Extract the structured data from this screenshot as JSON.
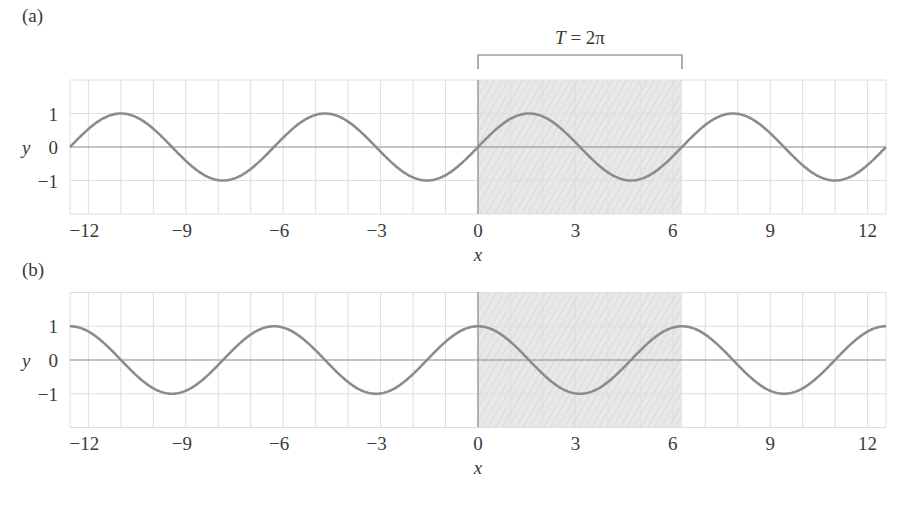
{
  "chart_data": [
    {
      "type": "line",
      "panel_label": "(a)",
      "function": "y = sin(x)",
      "xlabel": "x",
      "ylabel": "y",
      "xlim": [
        -12.566,
        12.566
      ],
      "ylim": [
        -2,
        2
      ],
      "x_ticks": [
        -12,
        -9,
        -6,
        -3,
        0,
        3,
        6,
        9,
        12
      ],
      "y_ticks": [
        1,
        0,
        -1
      ],
      "grid": true,
      "shaded_region": [
        0,
        6.283
      ],
      "annotation": "T = 2π",
      "series": [
        {
          "name": "sin(x)",
          "color": "#8c8c8c",
          "x": [
            -12.566,
            -10.996,
            -9.425,
            -7.854,
            -6.283,
            -4.712,
            -3.142,
            -1.571,
            0,
            1.571,
            3.142,
            4.712,
            6.283,
            7.854,
            9.425,
            10.996,
            12.566
          ],
          "values": [
            0,
            1,
            0,
            -1,
            0,
            1,
            0,
            -1,
            0,
            1,
            0,
            -1,
            0,
            1,
            0,
            -1,
            0
          ]
        }
      ]
    },
    {
      "type": "line",
      "panel_label": "(b)",
      "function": "y = cos(x)",
      "xlabel": "x",
      "ylabel": "y",
      "xlim": [
        -12.566,
        12.566
      ],
      "ylim": [
        -2,
        2
      ],
      "x_ticks": [
        -12,
        -9,
        -6,
        -3,
        0,
        3,
        6,
        9,
        12
      ],
      "y_ticks": [
        1,
        0,
        -1
      ],
      "grid": true,
      "shaded_region": [
        0,
        6.283
      ],
      "series": [
        {
          "name": "cos(x)",
          "color": "#8c8c8c",
          "x": [
            -12.566,
            -10.996,
            -9.425,
            -7.854,
            -6.283,
            -4.712,
            -3.142,
            -1.571,
            0,
            1.571,
            3.142,
            4.712,
            6.283,
            7.854,
            9.425,
            10.996,
            12.566
          ],
          "values": [
            1,
            0,
            -1,
            0,
            1,
            0,
            -1,
            0,
            1,
            0,
            -1,
            0,
            1,
            0,
            -1,
            0,
            1
          ]
        }
      ]
    }
  ],
  "panels": [
    {
      "label": "(a)",
      "fn": "sin",
      "top": 80,
      "bottom": 214,
      "zero": 147,
      "label_y": 22
    },
    {
      "label": "(b)",
      "fn": "cos",
      "top": 292,
      "bottom": 427,
      "zero": 360,
      "label_y": 276
    }
  ],
  "annotation": {
    "text": "T = 2π",
    "T": "T",
    "eq": " = 2π"
  },
  "axis": {
    "xlabel": "x",
    "ylabel": "y",
    "x_ticks": [
      -12,
      -9,
      -6,
      -3,
      0,
      3,
      6,
      9,
      12
    ],
    "y_ticks": [
      1,
      0,
      -1
    ]
  },
  "colors": {
    "curve": "#8c8c8c",
    "grid": "#dedede",
    "shade": "#e6e6e6",
    "axis": "#8a8a8a",
    "text": "#3a3a3a"
  }
}
